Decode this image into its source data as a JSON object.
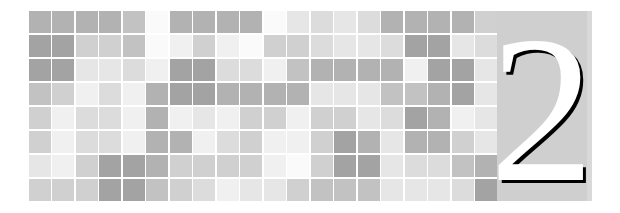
{
  "page": {
    "kind": "book-chapter-opener",
    "background_color": "#ffffff",
    "chapter_number": "2",
    "numeral_panel": {
      "background_color": "#cfcfcf",
      "numeral_fill_color": "#ffffff",
      "numeral_shadow_color": "#000000",
      "left": 497,
      "top": 11,
      "width": 95,
      "height": 190
    }
  },
  "mosaic": {
    "label": "decorative-checkerboard-band",
    "columns": 20,
    "rows": 8,
    "left": 29,
    "top": 11,
    "width": 468,
    "height": 190,
    "gap_color": "#ffffff",
    "palette": {
      "0": "#fafafa",
      "1": "#f0f0f0",
      "2": "#e6e6e6",
      "3": "#dcdcdc",
      "4": "#d0d0d0",
      "5": "#c2c2c2",
      "6": "#b2b2b2",
      "7": "#a3a3a3"
    },
    "grid": [
      [
        6,
        6,
        6,
        6,
        5,
        0,
        6,
        6,
        6,
        6,
        0,
        2,
        3,
        2,
        3,
        6,
        6,
        6,
        6,
        4
      ],
      [
        7,
        7,
        4,
        4,
        5,
        0,
        1,
        4,
        1,
        0,
        4,
        4,
        3,
        2,
        2,
        3,
        7,
        7,
        2,
        3
      ],
      [
        7,
        7,
        2,
        2,
        3,
        1,
        7,
        7,
        3,
        3,
        1,
        5,
        6,
        6,
        6,
        6,
        1,
        7,
        7,
        2
      ],
      [
        5,
        4,
        1,
        3,
        1,
        6,
        7,
        7,
        6,
        6,
        6,
        6,
        2,
        2,
        2,
        5,
        5,
        6,
        7,
        2
      ],
      [
        4,
        1,
        3,
        3,
        1,
        6,
        1,
        2,
        1,
        4,
        4,
        1,
        4,
        4,
        2,
        3,
        7,
        6,
        1,
        2
      ],
      [
        4,
        1,
        3,
        3,
        1,
        6,
        6,
        1,
        3,
        4,
        1,
        1,
        4,
        7,
        6,
        2,
        6,
        6,
        4,
        2
      ],
      [
        2,
        1,
        4,
        7,
        7,
        6,
        4,
        4,
        4,
        4,
        1,
        0,
        4,
        7,
        7,
        2,
        3,
        3,
        5,
        6
      ],
      [
        4,
        4,
        4,
        7,
        7,
        5,
        4,
        3,
        1,
        2,
        2,
        4,
        5,
        5,
        5,
        2,
        2,
        2,
        3,
        7
      ]
    ]
  }
}
